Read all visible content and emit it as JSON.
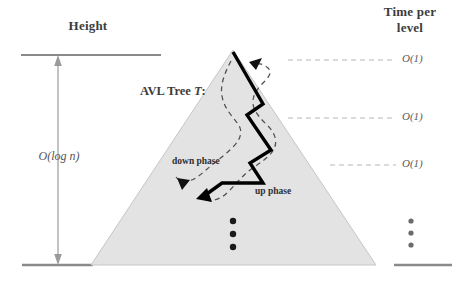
{
  "figure": {
    "background": "#ffffff",
    "width": 462,
    "height": 284
  },
  "left_axis": {
    "heading": "Height",
    "measure_label": "O(log n)",
    "measure_label_o": "O",
    "measure_label_arg": "(log n)",
    "top_rule_y": 55,
    "bottom_rule_y": 265,
    "arrow_x": 58,
    "rule_color": "#8a8a8a"
  },
  "tree": {
    "label_prefix": "AVL Tree ",
    "label_italic": "T",
    "label_suffix": ":",
    "fill_color": "#e3e3e3",
    "edge_color": "#c9c9c9",
    "apex": [
      233,
      50
    ],
    "base_left": [
      91,
      265
    ],
    "base_right": [
      376,
      265
    ]
  },
  "path": {
    "down_phase_label": "down phase",
    "up_phase_label": "up phase",
    "stroke_color": "#000000",
    "dashed_color": "#4f4f4f",
    "ellipsis_dots": 3
  },
  "right_axis": {
    "heading_line1": "Time per",
    "heading_line2": "level",
    "levels": [
      {
        "label": "O(1)",
        "label_o": "O",
        "label_arg": "(1)",
        "y": 60
      },
      {
        "label": "O(1)",
        "label_o": "O",
        "label_arg": "(1)",
        "y": 118
      },
      {
        "label": "O(1)",
        "label_o": "O",
        "label_arg": "(1)",
        "y": 165
      }
    ],
    "ellipsis_dots": 3,
    "bottom_rule_y": 265,
    "dash_color": "#b8b8b8",
    "rule_color": "#8a8a8a"
  }
}
